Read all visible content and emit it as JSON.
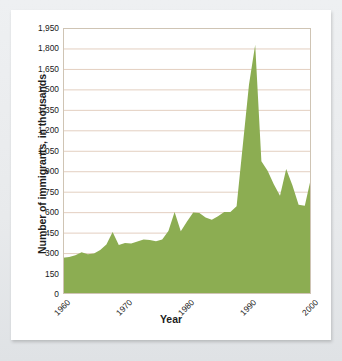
{
  "figure": {
    "title": "",
    "xlabel": "Year",
    "ylabel": "Number of immigrants, in thousands"
  },
  "colors": {
    "area_fill": "#8cad52",
    "gridline": "#e3cfc0",
    "frame": "#cfc4b4",
    "card_background": "#ffffff",
    "page_background": "#e8eaec",
    "text": "#191919"
  },
  "chart_data": {
    "type": "area",
    "title": "",
    "xlabel": "Year",
    "ylabel": "Number of immigrants, in thousands",
    "xlim": [
      1960,
      2000
    ],
    "ylim": [
      0,
      1950
    ],
    "grid": true,
    "legend": false,
    "xticks": [
      "1960",
      "1970",
      "1980",
      "1990",
      "2000"
    ],
    "xtick_values": [
      1960,
      1970,
      1980,
      1990,
      2000
    ],
    "yticks": [
      "0",
      "150",
      "300",
      "450",
      "600",
      "750",
      "900",
      "1,050",
      "1,200",
      "1,350",
      "1,500",
      "1,650",
      "1,800",
      "1,950"
    ],
    "ytick_values": [
      0,
      150,
      300,
      450,
      600,
      750,
      900,
      1050,
      1200,
      1350,
      1500,
      1650,
      1800,
      1950
    ],
    "series": [
      {
        "name": "Number of immigrants",
        "x": [
          1960,
          1961,
          1962,
          1963,
          1964,
          1965,
          1966,
          1967,
          1968,
          1969,
          1970,
          1971,
          1972,
          1973,
          1974,
          1975,
          1976,
          1977,
          1978,
          1979,
          1980,
          1981,
          1982,
          1983,
          1984,
          1985,
          1986,
          1987,
          1988,
          1989,
          1990,
          1991,
          1992,
          1993,
          1994,
          1995,
          1996,
          1997,
          1998,
          1999,
          2000
        ],
        "values": [
          265,
          271,
          284,
          306,
          292,
          297,
          323,
          362,
          454,
          359,
          373,
          370,
          385,
          400,
          395,
          386,
          399,
          462,
          601,
          460,
          531,
          597,
          594,
          560,
          544,
          570,
          602,
          602,
          643,
          1091,
          1536,
          1827,
          974,
          904,
          804,
          720,
          916,
          798,
          654,
          647,
          850
        ]
      }
    ]
  }
}
